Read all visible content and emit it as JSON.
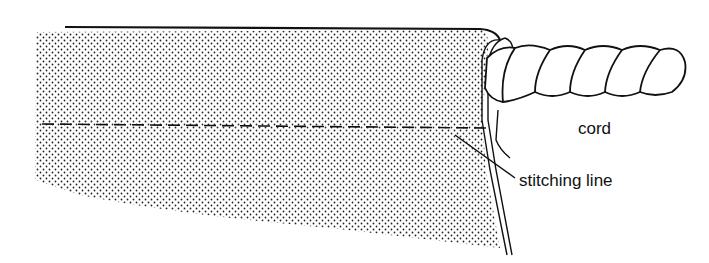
{
  "diagram": {
    "labels": {
      "cord": "cord",
      "stitching_line": "stitching line"
    },
    "colors": {
      "ink": "#111111",
      "background": "#ffffff"
    }
  }
}
